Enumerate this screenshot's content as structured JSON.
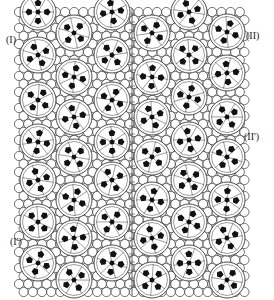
{
  "figure": {
    "colors": {
      "line": "#3a3a3a",
      "fill": "#ffffff",
      "pentagon": "#111111",
      "label": "#222222"
    },
    "lattice": {
      "x0": 19,
      "y0": 12,
      "x1": 248,
      "y1": 292,
      "dx": 9.2,
      "dy": 8.0,
      "r": 4.6
    },
    "divider_x": 132,
    "big_sphere_radius": 18,
    "columns": [
      {
        "x": 38,
        "ys": [
          12,
          55,
          100,
          142,
          180,
          222,
          263
        ]
      },
      {
        "x": 74,
        "ys": [
          33,
          77,
          117,
          157,
          200,
          238,
          280
        ]
      },
      {
        "x": 112,
        "ys": [
          12,
          55,
          100,
          142,
          180,
          222,
          263
        ]
      },
      {
        "x": 152,
        "ys": [
          33,
          77,
          117,
          157,
          200,
          238,
          280
        ]
      },
      {
        "x": 189,
        "ys": [
          12,
          55,
          97,
          140,
          180,
          222,
          263
        ]
      },
      {
        "x": 227,
        "ys": [
          32,
          73,
          117,
          157,
          200,
          238,
          280
        ]
      }
    ],
    "labels": [
      {
        "id": "label-I",
        "text": "(I)",
        "x": 6,
        "y": 34
      },
      {
        "id": "label-II",
        "text": "(II)",
        "x": 246,
        "y": 30
      },
      {
        "id": "label-II-prime",
        "text": "(II')",
        "x": 244,
        "y": 131
      },
      {
        "id": "label-I-prime",
        "text": "(I')",
        "x": 10,
        "y": 236
      }
    ]
  }
}
